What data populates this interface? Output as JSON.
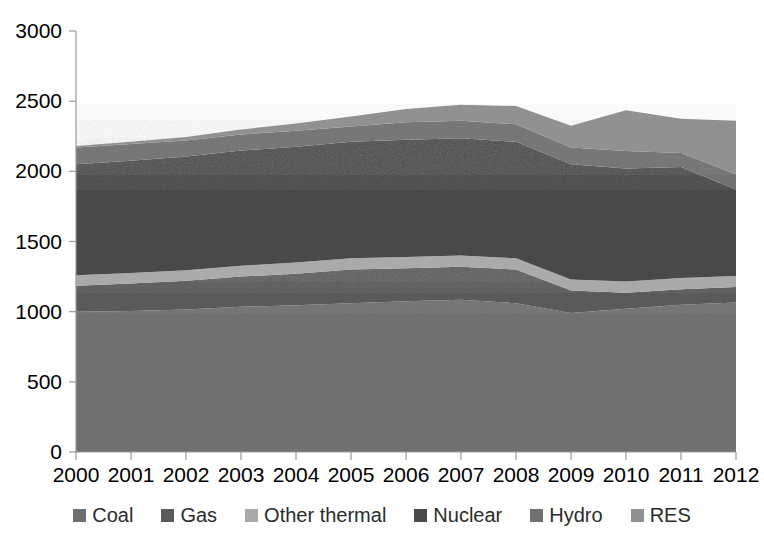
{
  "chart_data": {
    "type": "area",
    "stacked": true,
    "title": "",
    "subtitle": "",
    "xlabel": "",
    "ylabel": "",
    "grid": false,
    "legend_position": "bottom",
    "categories": [
      "2000",
      "2001",
      "2002",
      "2003",
      "2004",
      "2005",
      "2006",
      "2007",
      "2008",
      "2009",
      "2010",
      "2011",
      "2012"
    ],
    "x": [
      2000,
      2001,
      2002,
      2003,
      2004,
      2005,
      2006,
      2007,
      2008,
      2009,
      2010,
      2011,
      2012
    ],
    "xlim": [
      2000,
      2012
    ],
    "ylim": [
      0,
      3000
    ],
    "ytick_values": [
      0,
      500,
      1000,
      1500,
      2000,
      2500,
      3000
    ],
    "ytick_labels": [
      "0",
      "500",
      "1000",
      "1500",
      "2000",
      "2500",
      "3000"
    ],
    "xtick_labels": [
      "2000",
      "2001",
      "2002",
      "2003",
      "2004",
      "2005",
      "2006",
      "2007",
      "2008",
      "2009",
      "2010",
      "2011",
      "2012"
    ],
    "series": [
      {
        "name": "Coal",
        "color": "#6f6f6f",
        "values": [
          1000,
          1005,
          1015,
          1035,
          1045,
          1060,
          1075,
          1085,
          1060,
          990,
          1020,
          1050,
          1065
        ]
      },
      {
        "name": "Gas",
        "color": "#5a5a5a",
        "values": [
          185,
          195,
          205,
          215,
          225,
          240,
          235,
          235,
          240,
          160,
          115,
          110,
          110
        ]
      },
      {
        "name": "Other thermal",
        "color": "#a9a9a9",
        "values": [
          75,
          75,
          75,
          78,
          80,
          80,
          80,
          80,
          80,
          80,
          80,
          80,
          80
        ]
      },
      {
        "name": "Nuclear",
        "color": "#4a4a4a",
        "values": [
          790,
          800,
          810,
          820,
          825,
          830,
          835,
          835,
          830,
          820,
          805,
          790,
          615
        ]
      },
      {
        "name": "Hydro",
        "color": "#717171",
        "values": [
          120,
          120,
          115,
          115,
          115,
          110,
          125,
          125,
          125,
          120,
          125,
          100,
          110
        ]
      },
      {
        "name": "RES",
        "color": "#919191",
        "values": [
          10,
          15,
          25,
          35,
          50,
          70,
          95,
          115,
          130,
          155,
          290,
          245,
          380
        ]
      }
    ],
    "totals": [
      2180,
      2210,
      2245,
      2298,
      2340,
      2390,
      2445,
      2475,
      2465,
      2325,
      2435,
      2375,
      2360
    ]
  },
  "legend": {
    "items": [
      {
        "label": "Coal"
      },
      {
        "label": "Gas"
      },
      {
        "label": "Other thermal"
      },
      {
        "label": "Nuclear"
      },
      {
        "label": "Hydro"
      },
      {
        "label": "RES"
      }
    ]
  },
  "axes": {
    "y_labels": [
      "3000",
      "2500",
      "2000",
      "1500",
      "1000",
      "500",
      "0"
    ],
    "x_labels": [
      "2000",
      "2001",
      "2002",
      "2003",
      "2004",
      "2005",
      "2006",
      "2007",
      "2008",
      "2009",
      "2010",
      "2011",
      "2012"
    ]
  }
}
